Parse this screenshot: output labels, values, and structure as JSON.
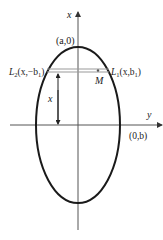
{
  "diagram": {
    "type": "ellipse-cross-section",
    "axes": {
      "vertical_label": "x",
      "horizontal_label": "y"
    },
    "points": {
      "top_vertex": "(a,0)",
      "right_vertex": "(0,b)",
      "chord_left": {
        "name": "L",
        "sub": "2",
        "coords_prefix": "(x,−b",
        "coords_sub": "1",
        "coords_suffix": ")"
      },
      "chord_right": {
        "name": "L",
        "sub": "1",
        "coords_prefix": "(x,b",
        "coords_sub": "1",
        "coords_suffix": ")"
      },
      "midpoint": "M"
    },
    "dimension_label": "x",
    "colors": {
      "ellipse": "#1a1a1a",
      "axes": "#555555",
      "chord": "#999999"
    }
  }
}
